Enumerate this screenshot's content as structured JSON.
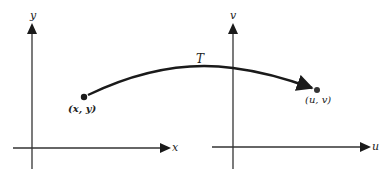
{
  "diagram": {
    "title": "",
    "colors": {
      "ink": "#1a1a1a",
      "background": "#ffffff"
    },
    "left_plane": {
      "horizontal_axis_label": "x",
      "vertical_axis_label": "y",
      "point_label": "(x, y)"
    },
    "right_plane": {
      "horizontal_axis_label": "u",
      "vertical_axis_label": "v",
      "point_label": "(u, v)"
    },
    "mapping": {
      "label": "T",
      "from": "(x, y)",
      "to": "(u, v)"
    }
  }
}
